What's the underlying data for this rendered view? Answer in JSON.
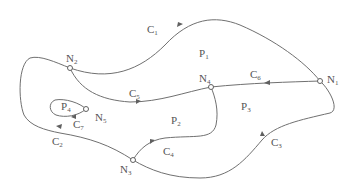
{
  "diagram": {
    "type": "planar-graph",
    "nodes": [
      {
        "id": "N1",
        "base": "N",
        "sub": "1",
        "x": 320,
        "y": 81,
        "lx": 327,
        "ly": 80
      },
      {
        "id": "N2",
        "base": "N",
        "sub": "2",
        "x": 70,
        "y": 68,
        "lx": 66,
        "ly": 59
      },
      {
        "id": "N3",
        "base": "N",
        "sub": "3",
        "x": 133,
        "y": 160,
        "lx": 121,
        "ly": 170
      },
      {
        "id": "N4",
        "base": "N",
        "sub": "4",
        "x": 211,
        "y": 87,
        "lx": 199,
        "ly": 81
      },
      {
        "id": "N5",
        "base": "N",
        "sub": "5",
        "x": 86,
        "y": 109,
        "lx": 96,
        "ly": 118
      }
    ],
    "edges": [
      {
        "id": "C1",
        "base": "C",
        "sub": "1",
        "lx": 147,
        "ly": 31
      },
      {
        "id": "C2",
        "base": "C",
        "sub": "2",
        "lx": 52,
        "ly": 142
      },
      {
        "id": "C3",
        "base": "C",
        "sub": "3",
        "lx": 271,
        "ly": 143
      },
      {
        "id": "C4",
        "base": "C",
        "sub": "4",
        "lx": 163,
        "ly": 153
      },
      {
        "id": "C5",
        "base": "C",
        "sub": "5",
        "lx": 129,
        "ly": 96
      },
      {
        "id": "C6",
        "base": "C",
        "sub": "6",
        "lx": 250,
        "ly": 77
      },
      {
        "id": "C7",
        "base": "C",
        "sub": "7",
        "lx": 73,
        "ly": 126
      }
    ],
    "regions": [
      {
        "id": "P1",
        "base": "P",
        "sub": "1",
        "lx": 199,
        "ly": 56
      },
      {
        "id": "P2",
        "base": "P",
        "sub": "2",
        "lx": 171,
        "ly": 123
      },
      {
        "id": "P3",
        "base": "P",
        "sub": "3",
        "lx": 241,
        "ly": 109
      },
      {
        "id": "P4",
        "base": "P",
        "sub": "4",
        "lx": 61,
        "ly": 109
      }
    ]
  },
  "labels": {
    "N1": "N",
    "N1_sub": "1",
    "N2": "N",
    "N2_sub": "2",
    "N3": "N",
    "N3_sub": "3",
    "N4": "N",
    "N4_sub": "4",
    "N5": "N",
    "N5_sub": "5",
    "C1": "C",
    "C1_sub": "1",
    "C2": "C",
    "C2_sub": "2",
    "C3": "C",
    "C3_sub": "3",
    "C4": "C",
    "C4_sub": "4",
    "C5": "C",
    "C5_sub": "5",
    "C6": "C",
    "C6_sub": "6",
    "C7": "C",
    "C7_sub": "7",
    "P1": "P",
    "P1_sub": "1",
    "P2": "P",
    "P2_sub": "2",
    "P3": "P",
    "P3_sub": "3",
    "P4": "P",
    "P4_sub": "4"
  },
  "colors": {
    "stroke": "#707070",
    "text": "#555555",
    "background": "#ffffff"
  }
}
